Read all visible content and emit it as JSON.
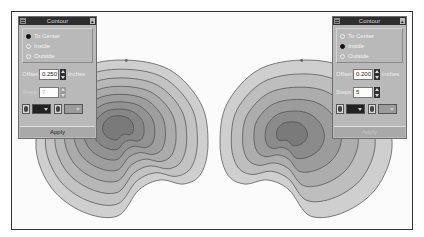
{
  "panels": [
    {
      "title": "Contour",
      "options": [
        {
          "label": "To Center",
          "selected": true
        },
        {
          "label": "Inside",
          "selected": false
        },
        {
          "label": "Outside",
          "selected": false
        }
      ],
      "offset_label": "Offset",
      "offset_value": "0.250",
      "unit": "inches",
      "steps_label": "Steps",
      "steps_value": "7",
      "steps_enabled": false,
      "apply_label": "Apply",
      "apply_enabled": true,
      "menu_icon": "window-menu-icon",
      "rollup_icon": "roll-up-icon"
    },
    {
      "title": "Contour",
      "options": [
        {
          "label": "To Center",
          "selected": false
        },
        {
          "label": "Inside",
          "selected": true
        },
        {
          "label": "Outside",
          "selected": false
        }
      ],
      "offset_label": "Offset",
      "offset_value": "0.200",
      "unit": "inches",
      "steps_label": "Steps",
      "steps_value": "5",
      "steps_enabled": true,
      "apply_label": "Apply",
      "apply_enabled": false,
      "menu_icon": "window-menu-icon",
      "rollup_icon": "roll-up-icon"
    }
  ],
  "colors": {
    "outer_fill": "#cfcfcf",
    "inner_fill": "#7a7a7a",
    "contour_stroke": "#4a4a4a",
    "panel_bg": "#b9b9b9",
    "titlebar": "#2e2e2e"
  },
  "contour_groups": [
    {
      "name": "left-contour-group",
      "mode": "To Center",
      "steps": 7
    },
    {
      "name": "right-contour-group",
      "mode": "Inside",
      "steps": 5
    }
  ]
}
